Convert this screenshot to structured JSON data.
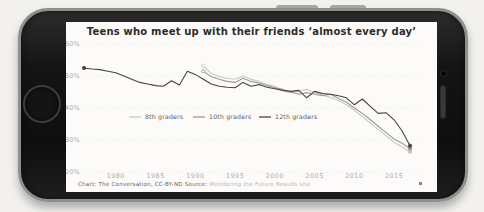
{
  "phone": {
    "body_color": "#141414",
    "rim_color": "#8f8f8d"
  },
  "screen": {
    "title": "Teens who meet up with their friends ‘almost every day’",
    "attribution_left": "Chart: The Conversation, CC-BY-ND Source:",
    "attribution_source": " Monitoring the Future Results site"
  },
  "chart_data": {
    "type": "line",
    "title": "Teens who meet up with their friends ‘almost every day’",
    "xlabel": "",
    "ylabel": "",
    "xlim": [
      1976,
      2018
    ],
    "ylim": [
      20,
      60
    ],
    "x_ticks": [
      1980,
      1985,
      1990,
      1995,
      2000,
      2005,
      2010,
      2015
    ],
    "y_tick_values": [
      60,
      50,
      40,
      30,
      20
    ],
    "y_tick_labels": [
      "60%",
      "50%",
      "40%",
      "30%",
      "20%"
    ],
    "grid": "horizontal-dotted",
    "legend_position": "inside-middle-left",
    "axis_label_color": "#aeaaa4",
    "grid_color": "#e6e4e0",
    "legend_text_color": "#5a5854",
    "series": [
      {
        "name": "8th graders",
        "color": "#c8c7c4",
        "x": [
          1991,
          1992,
          1993,
          1994,
          1995,
          1996,
          1997,
          1998,
          1999,
          2000,
          2001,
          2002,
          2003,
          2004,
          2005,
          2006,
          2007,
          2008,
          2009,
          2010,
          2011,
          2012,
          2013,
          2014,
          2015,
          2016,
          2017
        ],
        "values": [
          53.2,
          50.8,
          49.8,
          49.3,
          49.0,
          50.0,
          49.0,
          48.3,
          47.3,
          46.8,
          45.3,
          44.8,
          45.3,
          45.8,
          44.8,
          44.0,
          43.3,
          42.3,
          41.0,
          39.3,
          37.3,
          35.3,
          33.3,
          31.3,
          29.3,
          27.8,
          26.3
        ]
      },
      {
        "name": "10th graders",
        "color": "#9c9a97",
        "x": [
          1991,
          1992,
          1993,
          1994,
          1995,
          1996,
          1997,
          1998,
          1999,
          2000,
          2001,
          2002,
          2003,
          2004,
          2005,
          2006,
          2007,
          2008,
          2009,
          2010,
          2011,
          2012,
          2013,
          2014,
          2015,
          2016,
          2017
        ],
        "values": [
          51.5,
          49.8,
          49.0,
          48.3,
          48.0,
          49.3,
          48.3,
          47.8,
          47.0,
          46.3,
          45.8,
          45.0,
          44.3,
          44.8,
          44.3,
          43.8,
          44.3,
          43.0,
          41.8,
          40.0,
          38.3,
          36.3,
          34.3,
          32.3,
          30.3,
          29.0,
          27.3
        ]
      },
      {
        "name": "12th graders",
        "color": "#474542",
        "x": [
          1976,
          1977,
          1978,
          1979,
          1980,
          1981,
          1982,
          1983,
          1984,
          1985,
          1986,
          1987,
          1988,
          1989,
          1990,
          1991,
          1992,
          1993,
          1994,
          1995,
          1996,
          1997,
          1998,
          1999,
          2000,
          2001,
          2002,
          2003,
          2004,
          2005,
          2006,
          2007,
          2008,
          2009,
          2010,
          2011,
          2012,
          2013,
          2014,
          2015,
          2016,
          2017
        ],
        "values": [
          52.5,
          52.2,
          52.0,
          51.5,
          51.0,
          50.0,
          49.0,
          48.0,
          47.5,
          47.0,
          46.8,
          48.5,
          47.2,
          51.5,
          50.5,
          49.0,
          47.5,
          46.8,
          46.5,
          46.3,
          48.0,
          46.8,
          47.3,
          46.5,
          46.0,
          45.5,
          45.2,
          45.5,
          43.2,
          45.2,
          44.5,
          44.3,
          43.8,
          43.2,
          41.0,
          42.8,
          40.5,
          38.3,
          38.5,
          36.3,
          32.8,
          28.2
        ]
      }
    ]
  }
}
